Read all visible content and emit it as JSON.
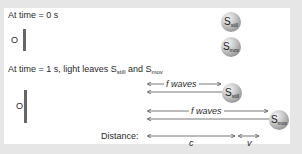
{
  "diagram": {
    "frame_t0": {
      "label": "At time = 0 s",
      "observer_label": "O",
      "sources": [
        {
          "name": "S",
          "subscript": "still"
        },
        {
          "name": "S",
          "subscript": "mov"
        }
      ]
    },
    "frame_t1": {
      "label_prefix": "At time = 1 s, light leaves S",
      "label_sub1": "still",
      "label_mid": " and S",
      "label_sub2": "mov",
      "observer_label": "O",
      "rows": [
        {
          "wave_label": "f waves",
          "source": {
            "name": "S",
            "subscript": "still"
          }
        },
        {
          "wave_label": "f waves",
          "source": {
            "name": "S",
            "subscript": "mov"
          }
        }
      ]
    },
    "distance": {
      "label": "Distance:",
      "segments": [
        {
          "label": "c"
        },
        {
          "label": "v"
        }
      ]
    },
    "colors": {
      "background": "#e6e6e6",
      "panel": "#ffffff",
      "bar": "#666666",
      "arrow": "#555555"
    }
  }
}
